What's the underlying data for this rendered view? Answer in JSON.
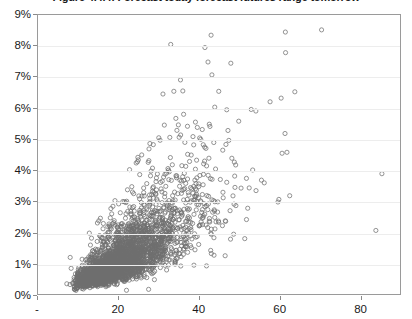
{
  "chart_data": {
    "type": "scatter",
    "title": "Figure 4.4.4: Forecast today forecast futures range tomorrow",
    "xlabel": "",
    "ylabel": "",
    "xlim": [
      0,
      90
    ],
    "ylim": [
      0,
      0.09
    ],
    "grid": true,
    "legend": null,
    "marker": {
      "shape": "open-circle",
      "size_px": 4.2,
      "stroke_color": "#6f6f6f",
      "fill": "none"
    },
    "y_ticks": [
      0,
      0.01,
      0.02,
      0.03,
      0.04,
      0.05,
      0.06,
      0.07,
      0.08,
      0.09
    ],
    "y_tick_labels": [
      "0%",
      "1%",
      "2%",
      "3%",
      "4%",
      "5%",
      "6%",
      "7%",
      "8%",
      "9%"
    ],
    "x_ticks": [
      0,
      20,
      40,
      60,
      80
    ],
    "x_tick_labels": [
      "-",
      "20",
      "40",
      "60",
      "80"
    ],
    "n_points": 3000,
    "correlation_approx": 0.62,
    "cluster": {
      "x_mode": 18,
      "y_mode": 0.016,
      "x_min": 7,
      "x_max": 86,
      "y_min": 0.001,
      "y_max": 0.0875
    },
    "notable_points": [
      {
        "x": 8.0,
        "y": 0.0118
      },
      {
        "x": 61.5,
        "y": 0.0845
      },
      {
        "x": 70.5,
        "y": 0.0852
      },
      {
        "x": 33.0,
        "y": 0.0805
      },
      {
        "x": 41.5,
        "y": 0.0795
      },
      {
        "x": 85.5,
        "y": 0.0388
      },
      {
        "x": 84.0,
        "y": 0.0205
      },
      {
        "x": 22.0,
        "y": 0.0012
      },
      {
        "x": 27.5,
        "y": 0.0015
      }
    ]
  },
  "axes": {
    "plot_border_color": "#9a9a9a",
    "gridline_color": "#ededed",
    "tick_color": "#8a8a8a",
    "label_color": "#1a1a1a"
  }
}
